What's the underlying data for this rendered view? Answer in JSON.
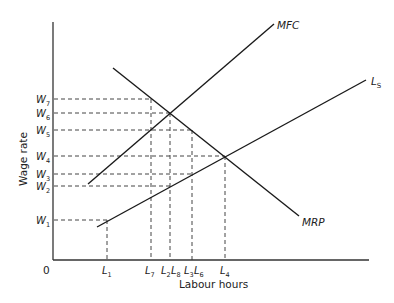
{
  "diagram": {
    "type": "labour-market-monopsony",
    "axes": {
      "origin_label": "0",
      "x_label": "Labour hours",
      "y_label": "Wage rate"
    },
    "curves": [
      {
        "name": "MFC",
        "label": "MFC",
        "label_sub": ""
      },
      {
        "name": "Ls",
        "label": "L",
        "label_sub": "S"
      },
      {
        "name": "MRP",
        "label": "MRP",
        "label_sub": ""
      }
    ],
    "wage_levels": [
      {
        "label": "W",
        "sub": "7"
      },
      {
        "label": "W",
        "sub": "6"
      },
      {
        "label": "W",
        "sub": "5"
      },
      {
        "label": "W",
        "sub": "4"
      },
      {
        "label": "W",
        "sub": "3"
      },
      {
        "label": "W",
        "sub": "2"
      },
      {
        "label": "W",
        "sub": "1"
      }
    ],
    "labour_levels": [
      {
        "label": "L",
        "sub": "1"
      },
      {
        "label": "L",
        "sub": "7"
      },
      {
        "label": "L",
        "sub": "2"
      },
      {
        "label": "L",
        "sub": "8"
      },
      {
        "label": "L",
        "sub": "3"
      },
      {
        "label": "L",
        "sub": "6"
      },
      {
        "label": "L",
        "sub": "4"
      }
    ],
    "colors": {
      "line": "#1a1a1a",
      "axis": "#333333",
      "dashed": "#444444"
    }
  }
}
